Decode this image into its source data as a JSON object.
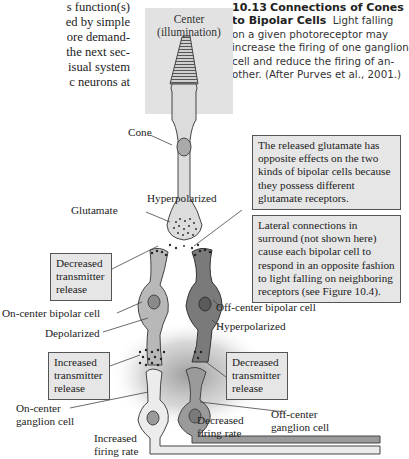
{
  "body_text": {
    "lines": [
      "s function(s)",
      "ed by simple",
      "ore demand-",
      "the next sec-",
      "isual system",
      "c neurons at"
    ]
  },
  "caption": {
    "number": "10.13",
    "title_line1": "Connections of Cones",
    "title_line2": "to Bipolar Cells",
    "text_line2": "Light falling",
    "lines": [
      "on a given photoreceptor may",
      "increase the firing of one ganglion",
      "cell and reduce the firing of an-",
      "other. (After Purves et al., 2001.)"
    ]
  },
  "diagram": {
    "panel_label_line1": "Center",
    "panel_label_line2": "(illumination)",
    "labels": {
      "cone": "Cone",
      "hyperpolarized_top": "Hyperpolarized",
      "glutamate": "Glutamate",
      "on_center_bipolar": "On-center bipolar cell",
      "depolarized": "Depolarized",
      "off_center_bipolar": "Off-center bipolar cell",
      "hyperpolarized_bottom": "Hyperpolarized",
      "on_center_ganglion_1": "On-center",
      "on_center_ganglion_2": "ganglion cell",
      "off_center_ganglion_1": "Off-center",
      "off_center_ganglion_2": "ganglion cell",
      "increased_firing_1": "Increased",
      "increased_firing_2": "firing rate",
      "decreased_firing_1": "Decreased",
      "decreased_firing_2": "firing rate"
    },
    "boxes": {
      "released_glutamate": [
        "The released glutamate has",
        "opposite effects on the two",
        "kinds of bipolar cells because",
        "they possess different",
        "glutamate receptors."
      ],
      "lateral_connections": [
        "Lateral connections in",
        "surround (not shown here)",
        "cause each bipolar cell to",
        "respond in an opposite fashion",
        "to light falling on neighboring",
        "receptors (see Figure 10.4)."
      ],
      "decreased_release_top": [
        "Decreased",
        "transmitter",
        "release"
      ],
      "increased_release": [
        "Increased",
        "transmitter",
        "release"
      ],
      "decreased_release_bottom": [
        "Decreased",
        "transmitter",
        "release"
      ]
    },
    "colors": {
      "panel_bg": "#e2e2e2",
      "on_cell": "#b8b8b8",
      "off_cell": "#7a7a7a",
      "light_cell": "#ececec",
      "outline": "#444444",
      "box_bg": "#e6e6e6"
    }
  }
}
